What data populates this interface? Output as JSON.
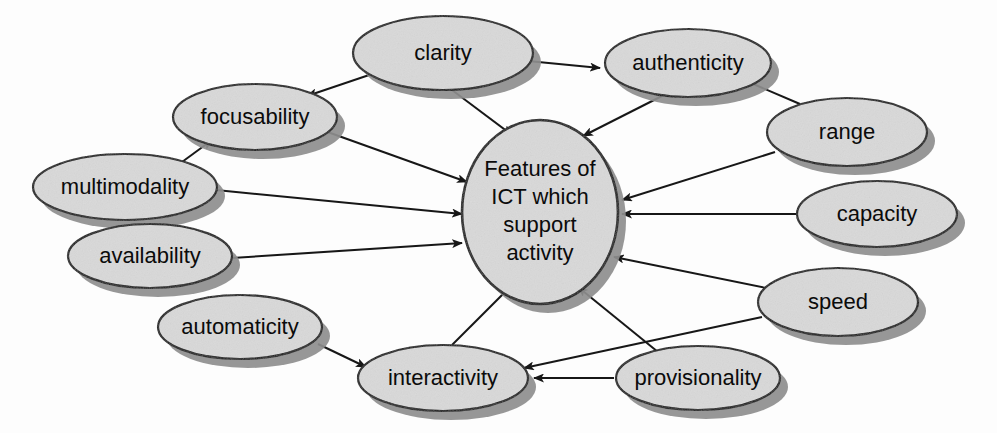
{
  "diagram": {
    "type": "concept-map",
    "background_color": "#fdfdfd",
    "node_fill_color": "#d9d9d9",
    "node_stroke_color": "#141414",
    "shadow_color": "#8e8e8e",
    "edge_color": "#171717",
    "hub": {
      "id": "hub",
      "label": "Features of ICT which support activity",
      "lines": [
        "Features of",
        "ICT which",
        "support",
        "activity"
      ],
      "cx": 540,
      "cy": 212,
      "rx": 78,
      "ry": 92
    },
    "nodes": [
      {
        "id": "clarity",
        "label": "clarity",
        "cx": 443,
        "cy": 53,
        "rx": 90,
        "ry": 37,
        "font": "med"
      },
      {
        "id": "authenticity",
        "label": "authenticity",
        "cx": 688,
        "cy": 63,
        "rx": 83,
        "ry": 34,
        "font": "med"
      },
      {
        "id": "focusability",
        "label": "focusability",
        "cx": 255,
        "cy": 117,
        "rx": 82,
        "ry": 33,
        "font": "med"
      },
      {
        "id": "range",
        "label": "range",
        "cx": 847,
        "cy": 132,
        "rx": 80,
        "ry": 34,
        "font": "med"
      },
      {
        "id": "multimodality",
        "label": "multimodality",
        "cx": 125,
        "cy": 187,
        "rx": 92,
        "ry": 33,
        "font": "med"
      },
      {
        "id": "capacity",
        "label": "capacity",
        "cx": 877,
        "cy": 214,
        "rx": 80,
        "ry": 33,
        "font": "med"
      },
      {
        "id": "availability",
        "label": "availability",
        "cx": 150,
        "cy": 256,
        "rx": 82,
        "ry": 32,
        "font": "med"
      },
      {
        "id": "speed",
        "label": "speed",
        "cx": 838,
        "cy": 302,
        "rx": 80,
        "ry": 34,
        "font": "med"
      },
      {
        "id": "automaticity",
        "label": "automaticity",
        "cx": 240,
        "cy": 327,
        "rx": 82,
        "ry": 32,
        "font": "med"
      },
      {
        "id": "interactivity",
        "label": "interactivity",
        "cx": 443,
        "cy": 378,
        "rx": 85,
        "ry": 33,
        "font": "med"
      },
      {
        "id": "provisionality",
        "label": "provisionality",
        "cx": 698,
        "cy": 378,
        "rx": 82,
        "ry": 32,
        "font": "med"
      }
    ],
    "edges": [
      {
        "from": "clarity",
        "to": "focusability",
        "x1": 378,
        "y1": 72,
        "x2": 307,
        "y2": 96
      },
      {
        "from": "clarity",
        "to": "authenticity",
        "x1": 528,
        "y1": 61,
        "x2": 600,
        "y2": 68
      },
      {
        "from": "clarity",
        "to": "hub",
        "x1": 452,
        "y1": 90,
        "x2": 512,
        "y2": 135
      },
      {
        "from": "authenticity",
        "to": "hub",
        "x1": 662,
        "y1": 96,
        "x2": 583,
        "y2": 136
      },
      {
        "from": "multimodality",
        "to": "focusability",
        "x1": 182,
        "y1": 162,
        "x2": 212,
        "y2": 140
      },
      {
        "from": "focusability",
        "to": "hub",
        "x1": 322,
        "y1": 130,
        "x2": 467,
        "y2": 182
      },
      {
        "from": "multimodality",
        "to": "hub",
        "x1": 216,
        "y1": 190,
        "x2": 462,
        "y2": 214
      },
      {
        "from": "availability",
        "to": "hub",
        "x1": 232,
        "y1": 258,
        "x2": 462,
        "y2": 243
      },
      {
        "from": "range",
        "to": "authenticity",
        "x1": 800,
        "y1": 104,
        "x2": 744,
        "y2": 80
      },
      {
        "from": "range",
        "to": "hub",
        "x1": 775,
        "y1": 152,
        "x2": 622,
        "y2": 200
      },
      {
        "from": "capacity",
        "to": "hub",
        "x1": 797,
        "y1": 214,
        "x2": 622,
        "y2": 214
      },
      {
        "from": "speed",
        "to": "hub",
        "x1": 766,
        "y1": 288,
        "x2": 614,
        "y2": 257
      },
      {
        "from": "speed",
        "to": "interactivity",
        "x1": 762,
        "y1": 317,
        "x2": 524,
        "y2": 368
      },
      {
        "from": "automaticity",
        "to": "interactivity",
        "x1": 318,
        "y1": 344,
        "x2": 366,
        "y2": 367
      },
      {
        "from": "interactivity",
        "to": "hub",
        "x1": 452,
        "y1": 345,
        "x2": 510,
        "y2": 287
      },
      {
        "from": "provisionality",
        "to": "hub",
        "x1": 658,
        "y1": 352,
        "x2": 578,
        "y2": 287
      },
      {
        "from": "provisionality",
        "to": "interactivity",
        "x1": 614,
        "y1": 378,
        "x2": 534,
        "y2": 378
      }
    ]
  }
}
